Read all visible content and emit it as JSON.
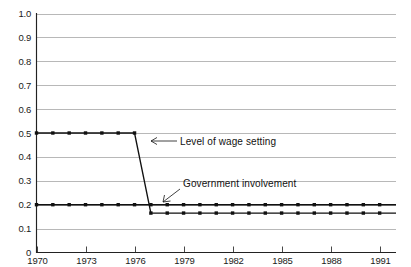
{
  "chart_data": {
    "type": "line",
    "title": "",
    "subtitle": "",
    "xlabel": "",
    "ylabel": "",
    "xlim": [
      1970,
      1992
    ],
    "ylim": [
      0,
      1.0
    ],
    "grid": true,
    "legend_position": "inline-annotations",
    "x_tick_labels": [
      "1970",
      "1973",
      "1976",
      "1979",
      "1982",
      "1985",
      "1988",
      "1991"
    ],
    "x_tick_values": [
      1970,
      1973,
      1976,
      1979,
      1982,
      1985,
      1988,
      1991
    ],
    "y_tick_labels": [
      "0",
      "0.1",
      "0.2",
      "0.3",
      "0.4",
      "0.5",
      "0.6",
      "0.7",
      "0.8",
      "0.9",
      "1.0"
    ],
    "y_tick_values": [
      0,
      0.1,
      0.2,
      0.3,
      0.4,
      0.5,
      0.6,
      0.7,
      0.8,
      0.9,
      1.0
    ],
    "x": [
      1970,
      1971,
      1972,
      1973,
      1974,
      1975,
      1976,
      1977,
      1978,
      1979,
      1980,
      1981,
      1982,
      1983,
      1984,
      1985,
      1986,
      1987,
      1988,
      1989,
      1990,
      1991,
      1992
    ],
    "series": [
      {
        "name": "Level of wage setting",
        "values": [
          0.5,
          0.5,
          0.5,
          0.5,
          0.5,
          0.5,
          0.5,
          0.165,
          0.165,
          0.165,
          0.165,
          0.165,
          0.165,
          0.165,
          0.165,
          0.165,
          0.165,
          0.165,
          0.165,
          0.165,
          0.165,
          0.165,
          0.165
        ]
      },
      {
        "name": "Government involvement",
        "values": [
          0.2,
          0.2,
          0.2,
          0.2,
          0.2,
          0.2,
          0.2,
          0.2,
          0.2,
          0.2,
          0.2,
          0.2,
          0.2,
          0.2,
          0.2,
          0.2,
          0.2,
          0.2,
          0.2,
          0.2,
          0.2,
          0.2,
          0.2
        ]
      }
    ],
    "annotations": [
      {
        "text": "Level of wage setting",
        "points_to_series": "Level of wage setting",
        "points_to_x": 1976.6,
        "points_to_y": 0.41
      },
      {
        "text": "Government involvement",
        "points_to_series": "Government involvement",
        "points_to_x": 1977.6,
        "points_to_y": 0.2
      }
    ],
    "colors": {
      "line": "#111111",
      "marker": "#111111",
      "grid": "#9a9a9a",
      "axis": "#222222",
      "background": "#ffffff"
    }
  },
  "annotation_labels": {
    "wage_setting": "Level of wage setting",
    "government_involvement": "Government involvement"
  }
}
